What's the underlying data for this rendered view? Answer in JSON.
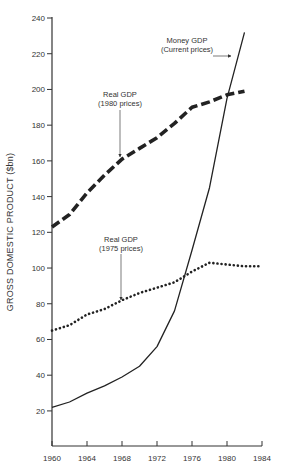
{
  "chart_data": {
    "type": "line",
    "title": "",
    "xlabel": "",
    "ylabel": "GROSS DOMESTIC PRODUCT ($bn)",
    "xlim": [
      1960,
      1984
    ],
    "ylim": [
      0,
      240
    ],
    "x_ticks": [
      1960,
      1964,
      1968,
      1972,
      1976,
      1980,
      1984
    ],
    "y_ticks": [
      20,
      40,
      60,
      80,
      100,
      120,
      140,
      160,
      180,
      200,
      220,
      240
    ],
    "grid": false,
    "legend": "inline annotations with arrows",
    "series": [
      {
        "name": "Money GDP (Current prices)",
        "style": "solid",
        "x": [
          1960,
          1962,
          1964,
          1966,
          1968,
          1970,
          1972,
          1974,
          1976,
          1978,
          1980,
          1982
        ],
        "values": [
          22,
          25,
          30,
          34,
          39,
          45,
          56,
          76,
          110,
          145,
          195,
          232
        ]
      },
      {
        "name": "Real GDP (1980 prices)",
        "style": "dashed",
        "x": [
          1960,
          1962,
          1964,
          1966,
          1968,
          1970,
          1972,
          1974,
          1976,
          1978,
          1980,
          1982
        ],
        "values": [
          123,
          130,
          142,
          152,
          161,
          167,
          173,
          181,
          190,
          193,
          197,
          199
        ]
      },
      {
        "name": "Real GDP (1975 prices)",
        "style": "dotted",
        "x": [
          1960,
          1962,
          1964,
          1966,
          1968,
          1970,
          1972,
          1974,
          1976,
          1978,
          1980,
          1982,
          1984
        ],
        "values": [
          65,
          68,
          74,
          77,
          82,
          86,
          89,
          92,
          98,
          103,
          102,
          101,
          101
        ]
      }
    ],
    "annotations": [
      {
        "line1": "Money GDP",
        "line2": "(Current prices)",
        "points_to": "Money GDP"
      },
      {
        "line1": "Real GDP",
        "line2": "(1980 prices)",
        "points_to": "Real GDP (1980 prices)"
      },
      {
        "line1": "Real GDP",
        "line2": "(1975 prices)",
        "points_to": "Real GDP (1975 prices)"
      }
    ]
  }
}
